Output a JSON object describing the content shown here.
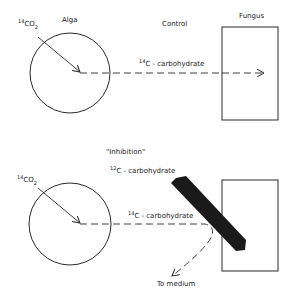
{
  "control": {
    "title": "Control",
    "alga_label": "Alga",
    "fungus_label": "Fungus",
    "input": {
      "isotope": "14",
      "formula": "CO",
      "subscript": "2"
    },
    "flow": {
      "isotope": "14",
      "label": "C - carbohydrate"
    }
  },
  "inhibition": {
    "title": "\"Inhibition\"",
    "input": {
      "isotope": "14",
      "formula": "CO",
      "subscript": "2"
    },
    "blocker": {
      "isotope": "12",
      "label": "C - carbohydrate"
    },
    "flow": {
      "isotope": "14",
      "label": "C - carbohydrate"
    },
    "diverted_label": "To medium"
  },
  "colors": {
    "stroke": "#2a2a2a",
    "background": "#ffffff",
    "bar": "#1a1a1a"
  }
}
